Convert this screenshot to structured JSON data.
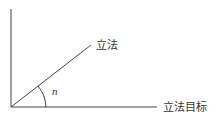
{
  "diagram": {
    "type": "angle-diagram",
    "line_color": "#444444",
    "text_color": "#333333",
    "origin": {
      "x": 11,
      "y": 107
    },
    "vertical_axis": {
      "x1": 11,
      "y1": 9,
      "x2": 11,
      "y2": 107
    },
    "horizontal_axis": {
      "x1": 11,
      "y1": 107,
      "x2": 157,
      "y2": 107,
      "label": "立法目标"
    },
    "diagonal_line": {
      "x1": 11,
      "y1": 107,
      "x2": 91,
      "y2": 45,
      "label": "立法"
    },
    "angle": {
      "label": "n"
    }
  }
}
